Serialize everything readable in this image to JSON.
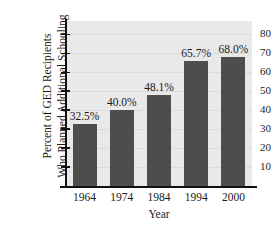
{
  "chart_data": {
    "type": "bar",
    "title": "",
    "categories": [
      "1964",
      "1974",
      "1984",
      "1994",
      "2000"
    ],
    "values": [
      32.5,
      40.0,
      48.1,
      65.7,
      68.0
    ],
    "data_labels": [
      "32.5%",
      "40.0%",
      "48.1%",
      "65.7%",
      "68.0%"
    ],
    "xlabel": "Year",
    "ylabel_lines": [
      "Percent of GED Recipients",
      "Who Planned Additional Schooling"
    ],
    "ylabel": "Percent of GED Recipients Who Planned Additional Schooling",
    "ylim": [
      0,
      87
    ],
    "yticks": [
      10,
      20,
      30,
      40,
      50,
      60,
      70,
      80
    ],
    "ytick_labels": [
      "10",
      "20",
      "30",
      "40",
      "50",
      "60",
      "70",
      "80"
    ],
    "grid": true,
    "legend": false,
    "colors": {
      "bar": "#4d4d4d",
      "plot_background": "#e9e9e9",
      "gridline": "#dcdcdc",
      "axis": "#111111",
      "text": "#1a1a1a",
      "figure_background": "#ffffff"
    }
  }
}
